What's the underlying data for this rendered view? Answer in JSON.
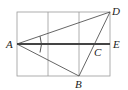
{
  "diagram": {
    "type": "geometry-grid",
    "grid": {
      "columns": 3,
      "rows": 2
    },
    "points": {
      "A": {
        "label": "A",
        "x": 17,
        "y": 44
      },
      "B": {
        "label": "B",
        "x": 79,
        "y": 76
      },
      "C": {
        "label": "C",
        "x": 95,
        "y": 44
      },
      "D": {
        "label": "D",
        "x": 110,
        "y": 12
      },
      "E": {
        "label": "E",
        "x": 110,
        "y": 44
      }
    },
    "segments": [
      "AD",
      "AB",
      "BD",
      "AE"
    ],
    "angle_marks": [
      "DAB"
    ],
    "colors": {
      "grid": "#9a9a9a",
      "line": "#555555",
      "thick": "#444444"
    }
  }
}
